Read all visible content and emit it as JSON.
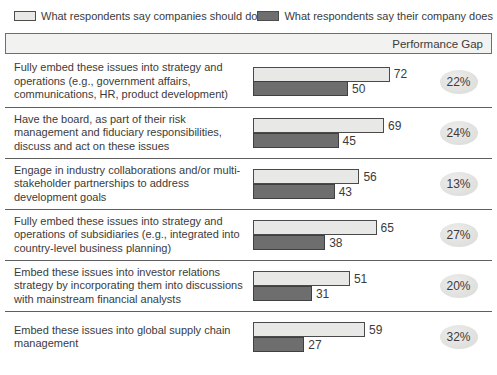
{
  "legend": {
    "items": [
      {
        "label": "What respondents say companies should do",
        "color": "#e8e8e6"
      },
      {
        "label": "What respondents say their company does",
        "color": "#6e6e6e"
      }
    ]
  },
  "header": {
    "label": "Performance Gap"
  },
  "chart_data": {
    "type": "bar",
    "orientation": "horizontal",
    "title": "",
    "legend_position": "top",
    "xlim": [
      0,
      80
    ],
    "grid": false,
    "value_labels": true,
    "categories": [
      "Fully embed these issues into strategy and operations (e.g., government affairs, communications, HR, product development)",
      "Have the board, as part of their risk management and fiduciary responsibilities, discuss and act on these issues",
      "Engage in industry collaborations and/or multi-stakeholder partnerships to address development goals",
      "Fully embed these issues into strategy and operations of subsidiaries (e.g., integrated into country-level business planning)",
      "Embed these issues into investor relations strategy by incorporating them into discussions with mainstream financial analysts",
      "Embed these issues into global supply chain management"
    ],
    "series": [
      {
        "name": "What respondents say companies should do",
        "color": "#e8e8e6",
        "values": [
          72,
          69,
          56,
          65,
          51,
          59
        ]
      },
      {
        "name": "What respondents say their company does",
        "color": "#6e6e6e",
        "values": [
          50,
          45,
          43,
          38,
          31,
          27
        ]
      }
    ],
    "performance_gaps": [
      "22%",
      "24%",
      "13%",
      "27%",
      "20%",
      "32%"
    ]
  }
}
